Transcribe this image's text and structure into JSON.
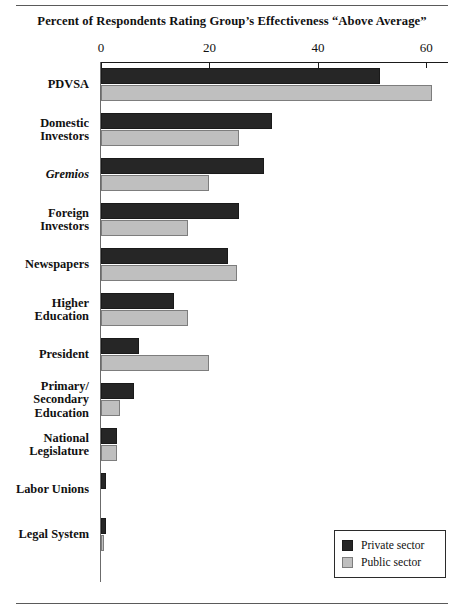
{
  "figure": {
    "title": "Percent of Respondents Rating Group’s Effectiveness “Above Average”",
    "rules": {
      "top": "horizontal-rule",
      "bottom": "horizontal-rule"
    }
  },
  "legend": {
    "items": [
      {
        "label": "Private sector",
        "color": "#262626",
        "swatch": "private-sector-swatch"
      },
      {
        "label": "Public sector",
        "color": "#bfbfbf",
        "swatch": "public-sector-swatch"
      }
    ]
  },
  "chart_data": {
    "type": "bar",
    "orientation": "horizontal",
    "title": "Percent of Respondents Rating Group’s Effectiveness “Above Average”",
    "xlabel": "",
    "ylabel": "",
    "xlim": [
      0,
      64
    ],
    "xticks": [
      0,
      20,
      40,
      60
    ],
    "xticklabels": [
      "0",
      "20",
      "40",
      "60"
    ],
    "grid": false,
    "legend_position": "bottom-right",
    "categories": [
      "PDVSA",
      "Domestic\nInvestors",
      "Gremios",
      "Foreign\nInvestors",
      "Newspapers",
      "Higher\nEducation",
      "President",
      "Primary/\nSecondary\nEducation",
      "National\nLegislature",
      "Labor Unions",
      "Legal System"
    ],
    "categories_plain": [
      "PDVSA",
      "Domestic Investors",
      "Gremios",
      "Foreign Investors",
      "Newspapers",
      "Higher Education",
      "President",
      "Primary/Secondary Education",
      "National Legislature",
      "Labor Unions",
      "Legal System"
    ],
    "italic_categories": [
      "Gremios"
    ],
    "series": [
      {
        "name": "Private sector",
        "color": "#262626",
        "values": [
          51.5,
          31.5,
          30,
          25.5,
          23.5,
          13.5,
          7,
          6,
          3,
          1,
          1
        ]
      },
      {
        "name": "Public sector",
        "color": "#bfbfbf",
        "values": [
          61,
          25.5,
          20,
          16,
          25,
          16,
          20,
          3.5,
          3,
          0,
          0.5
        ]
      }
    ]
  }
}
